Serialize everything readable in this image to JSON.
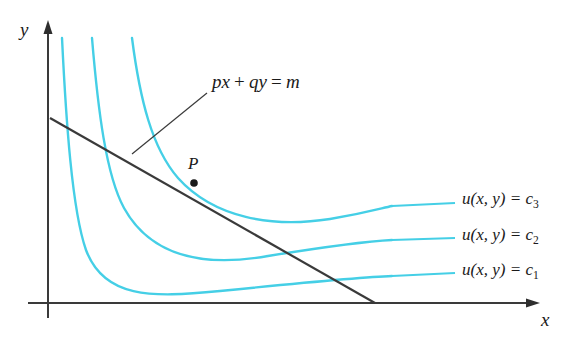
{
  "figure": {
    "background_color": "#ffffff",
    "axis_color": "#3a3a3a",
    "curve_color": "#45CFE6",
    "line_color": "#3a3a3a"
  },
  "axes": {
    "x_label": "x",
    "y_label": "y",
    "origin": {
      "x": 48,
      "y": 303
    },
    "x_axis_end": {
      "x": 540,
      "y": 303
    },
    "y_axis_end": {
      "x": 48,
      "y": 22
    }
  },
  "budget_line": {
    "label_prefix": "p",
    "label": "px + qy = m",
    "label_parts": {
      "p": "p",
      "x": "x",
      "plus": "+",
      "q": "q",
      "y": "y",
      "equals": "=",
      "m": "m"
    },
    "y_intercept": {
      "x": 50,
      "y": 118
    },
    "x_intercept": {
      "x": 375,
      "y": 303
    },
    "label_position": {
      "x": 212,
      "y": 72
    },
    "leader_start": {
      "x": 132,
      "y": 154
    },
    "leader_end": {
      "x": 207,
      "y": 93
    }
  },
  "tangency_point": {
    "label": "P",
    "position": {
      "x": 194,
      "y": 183
    },
    "label_position": {
      "x": 190,
      "y": 158
    }
  },
  "curves": [
    {
      "id": "c1",
      "label": "u(x, y) = c",
      "subscript": "1",
      "label_position": {
        "x": 462,
        "y": 268
      },
      "leader_start": {
        "x": 390,
        "y": 277
      },
      "leader_end": {
        "x": 455,
        "y": 274
      }
    },
    {
      "id": "c2",
      "label": "u(x, y) = c",
      "subscript": "2",
      "label_position": {
        "x": 462,
        "y": 233
      },
      "leader_start": {
        "x": 390,
        "y": 243
      },
      "leader_end": {
        "x": 455,
        "y": 239
      }
    },
    {
      "id": "c3",
      "label": "u(x, y) = c",
      "subscript": "3",
      "label_position": {
        "x": 462,
        "y": 198
      },
      "leader_start": {
        "x": 390,
        "y": 210
      },
      "leader_end": {
        "x": 455,
        "y": 204
      }
    }
  ],
  "curve_label_pieces": {
    "u": "u",
    "open_paren": "(",
    "x": "x",
    "comma": ",",
    "y": "y",
    "close_paren": ")",
    "equals": "=",
    "c": "c"
  }
}
